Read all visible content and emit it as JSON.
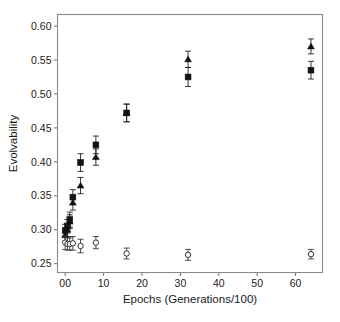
{
  "figure": {
    "background_color": "#ffffff",
    "frame_color": "#8a8a8a",
    "marker_color": "#111111",
    "open_marker_color": "#333333"
  },
  "chart_data": {
    "type": "scatter",
    "title": "",
    "xlabel": "Epochs (Generations/100)",
    "ylabel": "Evolvability",
    "xlim": [
      -2,
      67
    ],
    "ylim": [
      0.237,
      0.617
    ],
    "grid": false,
    "legend_position": "none",
    "xticks": [
      0,
      10,
      20,
      30,
      40,
      50,
      60
    ],
    "xtick_labels": [
      "00",
      "10",
      "20",
      "30",
      "40",
      "50",
      "60"
    ],
    "yticks": [
      0.25,
      0.3,
      0.35,
      0.4,
      0.45,
      0.5,
      0.55,
      0.6
    ],
    "ytick_labels": [
      "0.25",
      "0.30",
      "0.35",
      "0.40",
      "0.45",
      "0.50",
      "0.55",
      "0.60"
    ],
    "series": [
      {
        "name": "filled-square",
        "marker": "square-filled",
        "x": [
          0,
          0.6,
          1.2,
          2,
          4,
          8,
          16,
          32,
          64
        ],
        "y": [
          0.299,
          0.305,
          0.315,
          0.348,
          0.399,
          0.425,
          0.472,
          0.525,
          0.535
        ],
        "yerr": [
          0.009,
          0.01,
          0.011,
          0.011,
          0.013,
          0.013,
          0.013,
          0.014,
          0.013
        ]
      },
      {
        "name": "filled-triangle",
        "marker": "triangle-filled",
        "x": [
          0,
          0.6,
          1.2,
          2,
          4,
          8,
          16,
          32,
          64
        ],
        "y": [
          0.292,
          0.3,
          0.312,
          0.34,
          0.365,
          0.407,
          0.472,
          0.551,
          0.57
        ],
        "yerr": [
          0.009,
          0.01,
          0.01,
          0.011,
          0.012,
          0.012,
          0.013,
          0.012,
          0.011
        ]
      },
      {
        "name": "open-circle",
        "marker": "circle-open",
        "x": [
          0,
          0.6,
          1.2,
          2,
          4,
          8,
          16,
          32,
          64
        ],
        "y": [
          0.281,
          0.279,
          0.279,
          0.28,
          0.276,
          0.281,
          0.265,
          0.263,
          0.264
        ],
        "yerr": [
          0.01,
          0.009,
          0.009,
          0.01,
          0.01,
          0.009,
          0.008,
          0.008,
          0.007
        ]
      }
    ]
  }
}
